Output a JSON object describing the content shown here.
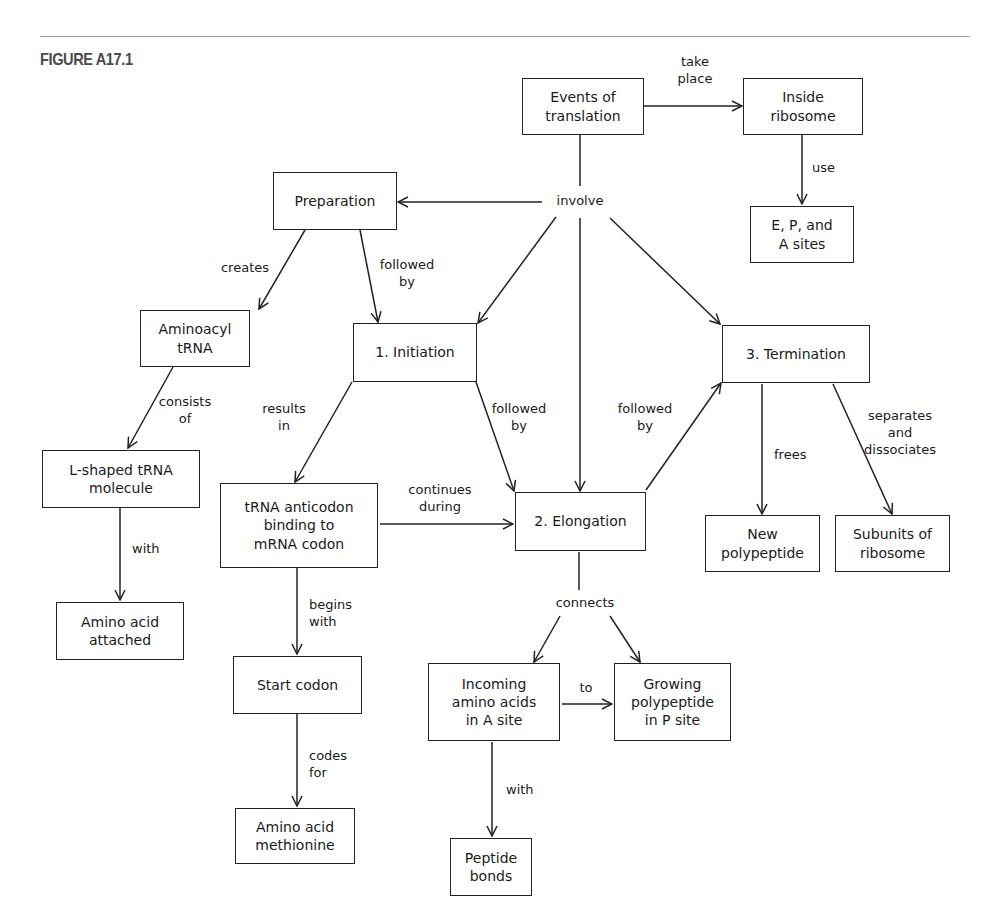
{
  "figure": {
    "label": "FIGURE A17.1"
  },
  "nodes": {
    "events": "Events of\ntranslation",
    "inside_ribosome": "Inside\nribosome",
    "sites": "E, P, and\nA sites",
    "preparation": "Preparation",
    "aminoacyl": "Aminoacyl\ntRNA",
    "initiation": "1. Initiation",
    "termination": "3. Termination",
    "lshaped": "L-shaped tRNA\nmolecule",
    "anticodon": "tRNA anticodon\nbinding to\nmRNA codon",
    "elongation": "2. Elongation",
    "new_polypeptide": "New\npolypeptide",
    "subunits": "Subunits of\nribosome",
    "amino_attached": "Amino acid\nattached",
    "start_codon": "Start codon",
    "incoming": "Incoming\namino acids\nin A site",
    "growing": "Growing\npolypeptide\nin P site",
    "methionine": "Amino acid\nmethionine",
    "peptide_bonds": "Peptide\nbonds"
  },
  "links": {
    "take_place": "take\nplace",
    "use": "use",
    "involve": "involve",
    "creates": "creates",
    "followed_by_prep": "followed\nby",
    "consists_of": "consists\nof",
    "results_in": "results\nin",
    "followed_by_init": "followed\nby",
    "followed_by_elong": "followed\nby",
    "frees": "frees",
    "separates": "separates\nand\ndissociates",
    "continues_during": "continues\nduring",
    "with_lshaped": "with",
    "begins_with": "begins\nwith",
    "connects": "connects",
    "to": "to",
    "codes_for": "codes\nfor",
    "with_incoming": "with"
  },
  "colors": {
    "ink": "#1a1a1a",
    "rule": "#9a9a9a",
    "figure_label": "#4a4a4a"
  }
}
